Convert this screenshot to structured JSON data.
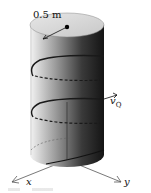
{
  "figure": {
    "type": "physics-diagram",
    "labels": {
      "radius": "0.5 m",
      "velocity_symbol": "v",
      "velocity_subscript": "Q",
      "x_axis": "x",
      "y_axis": "y"
    },
    "colors": {
      "background": "#ffffff",
      "top_face": "#d9d9d9",
      "shade_light": "#f2f2f2",
      "shade_dark": "#1a1a1a",
      "helix": "#1a1a1a",
      "axes": "#444444"
    },
    "helix_turns_visible": 2
  }
}
